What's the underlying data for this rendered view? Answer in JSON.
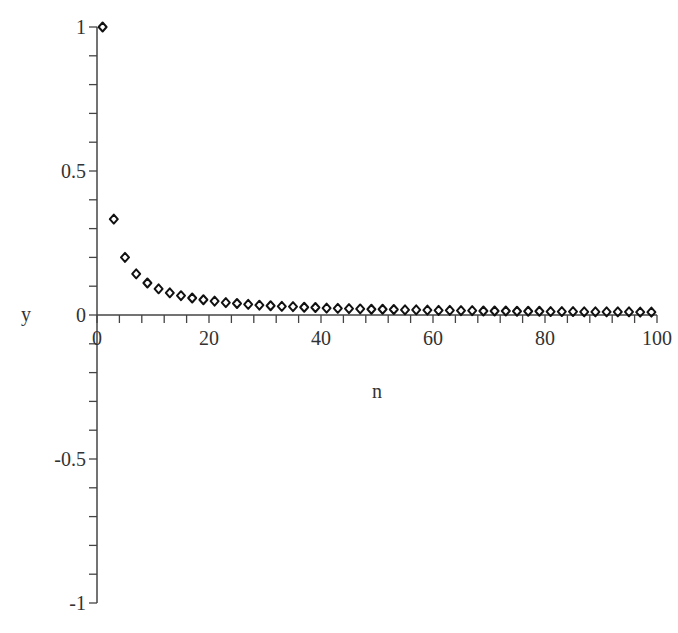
{
  "chart_data": {
    "type": "scatter",
    "title": "",
    "xlabel": "n",
    "ylabel": "y",
    "xlim": [
      0,
      100
    ],
    "ylim": [
      -1,
      1
    ],
    "grid": false,
    "legend": null,
    "marker": "diamond",
    "x_ticks": [
      0,
      20,
      40,
      60,
      80,
      100
    ],
    "x_tick_labels": [
      "0",
      "20",
      "40",
      "60",
      "80",
      "100"
    ],
    "y_ticks": [
      1,
      0.5,
      0,
      -0.5,
      -1
    ],
    "y_tick_labels": [
      "1",
      "0.5",
      "0",
      "-0.5",
      "-1"
    ],
    "series": [
      {
        "name": "y = 1/n (odd n)",
        "x": [
          1,
          3,
          5,
          7,
          9,
          11,
          13,
          15,
          17,
          19,
          21,
          23,
          25,
          27,
          29,
          31,
          33,
          35,
          37,
          39,
          41,
          43,
          45,
          47,
          49,
          51,
          53,
          55,
          57,
          59,
          61,
          63,
          65,
          67,
          69,
          71,
          73,
          75,
          77,
          79,
          81,
          83,
          85,
          87,
          89,
          91,
          93,
          95,
          97,
          99
        ],
        "y": [
          1,
          0.333,
          0.2,
          0.143,
          0.111,
          0.091,
          0.077,
          0.067,
          0.059,
          0.053,
          0.048,
          0.043,
          0.04,
          0.037,
          0.034,
          0.032,
          0.03,
          0.029,
          0.027,
          0.026,
          0.024,
          0.023,
          0.022,
          0.021,
          0.02,
          0.02,
          0.019,
          0.018,
          0.018,
          0.017,
          0.016,
          0.016,
          0.015,
          0.015,
          0.014,
          0.014,
          0.014,
          0.013,
          0.013,
          0.013,
          0.012,
          0.012,
          0.012,
          0.011,
          0.011,
          0.011,
          0.011,
          0.011,
          0.01,
          0.01
        ]
      }
    ]
  }
}
